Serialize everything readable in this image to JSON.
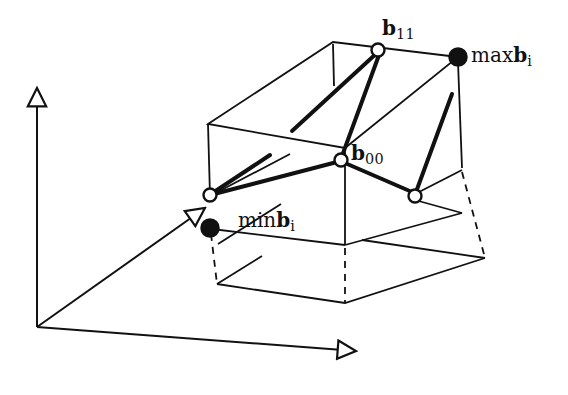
{
  "figure": {
    "background_color": "#ffffff",
    "stroke_color": "#111111",
    "width": 568,
    "height": 395
  },
  "labels": {
    "b11": {
      "operator": "",
      "vector": "b",
      "subscript": "11"
    },
    "b00": {
      "operator": "",
      "vector": "b",
      "subscript": "00"
    },
    "max": {
      "operator": "max",
      "vector": "b",
      "subscript": "i"
    },
    "min": {
      "operator": "min",
      "vector": "b",
      "subscript": "i"
    }
  },
  "axes": {
    "origin": [
      37,
      327
    ],
    "vertical": {
      "name": "vertical-axis",
      "from": [
        37,
        327
      ],
      "to": [
        37,
        84
      ],
      "arrow": "hollow-triangle"
    },
    "horizontal": {
      "name": "horizontal-axis",
      "from": [
        37,
        327
      ],
      "to": [
        361,
        352
      ],
      "arrow": "hollow-triangle"
    },
    "depth": {
      "name": "depth-axis",
      "from": [
        37,
        327
      ],
      "to": [
        201,
        212
      ],
      "arrow": "hollow-triangle"
    }
  },
  "box": {
    "name": "bounding-box",
    "top_face": [
      [
        208,
        124
      ],
      [
        333,
        42
      ],
      [
        458,
        57
      ],
      [
        345,
        148
      ]
    ],
    "front_face": [
      [
        208,
        124
      ],
      [
        345,
        148
      ],
      [
        345,
        245
      ],
      [
        210,
        228
      ]
    ],
    "right_face": [
      [
        345,
        148
      ],
      [
        458,
        57
      ],
      [
        462,
        168
      ],
      [
        345,
        245
      ]
    ],
    "hidden_edge": {
      "from": [
        333,
        42
      ],
      "to": [
        334,
        86
      ]
    },
    "hidden_edge_right": {
      "from": [
        462,
        168
      ],
      "to": [
        415,
        196
      ]
    }
  },
  "shadow_plane": {
    "name": "projection-plane",
    "polygon": [
      [
        217,
        284
      ],
      [
        345,
        303
      ],
      [
        485,
        258
      ],
      [
        358,
        240
      ]
    ],
    "dashed_drops": [
      {
        "from": [
          210,
          228
        ],
        "to": [
          217,
          284
        ]
      },
      {
        "from": [
          345,
          245
        ],
        "to": [
          345,
          303
        ]
      },
      {
        "from": [
          462,
          168
        ],
        "to": [
          485,
          258
        ]
      }
    ]
  },
  "nodes": [
    {
      "name": "node-b11",
      "point": [
        378,
        50
      ],
      "style": "hollow"
    },
    {
      "name": "node-b00",
      "point": [
        341,
        160
      ],
      "style": "hollow"
    },
    {
      "name": "node-left",
      "point": [
        210,
        195
      ],
      "style": "hollow"
    },
    {
      "name": "node-right",
      "point": [
        415,
        196
      ],
      "style": "hollow"
    },
    {
      "name": "node-max",
      "point": [
        458,
        57
      ],
      "style": "filled"
    },
    {
      "name": "node-min",
      "point": [
        210,
        228
      ],
      "style": "filled"
    }
  ],
  "control_polygon": {
    "name": "control-polygon",
    "stroke_width": 4,
    "edges": [
      {
        "from": [
          378,
          50
        ],
        "to": [
          292,
          130
        ]
      },
      {
        "from": [
          378,
          50
        ],
        "to": [
          341,
          160
        ]
      },
      {
        "from": [
          341,
          160
        ],
        "to": [
          210,
          195
        ]
      },
      {
        "from": [
          341,
          160
        ],
        "to": [
          415,
          196
        ]
      },
      {
        "from": [
          415,
          196
        ],
        "to": [
          451,
          93
        ]
      },
      {
        "from": [
          210,
          195
        ],
        "to": [
          268,
          157
        ]
      }
    ]
  }
}
